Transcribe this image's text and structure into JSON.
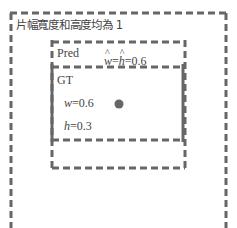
{
  "diagram": {
    "outer_box": {
      "label": "片幅寬度和高度均為 1",
      "style": "dashed"
    },
    "pred_box": {
      "label": "Pred",
      "annotation": {
        "w_symbol": "w",
        "h_symbol": "h",
        "eq": "=",
        "value": "=0.6"
      },
      "style": "dashed"
    },
    "gt_box": {
      "label": "GT",
      "width_label": {
        "symbol": "w",
        "value": "=0.6"
      },
      "height_label": {
        "symbol": "h",
        "value": "=0.3"
      },
      "style": "solid-sides-dashed-top-bottom"
    },
    "center_point": {
      "shape": "circle"
    },
    "colors": {
      "stroke": "#666666",
      "text": "#444444",
      "dot": "#666666"
    }
  }
}
